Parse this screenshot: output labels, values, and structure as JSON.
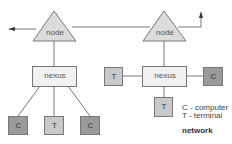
{
  "diagram": {
    "title": "network",
    "colors": {
      "line": "#777777",
      "node_fill": "#dcdcdc",
      "nexus_fill": "#f1f1f1",
      "computer_fill": "#9a9a9a",
      "terminal_fill": "#c9c9c9",
      "box_border": "#777777"
    },
    "nodes": [
      {
        "id": "node-left",
        "label": "node"
      },
      {
        "id": "node-right",
        "label": "node"
      }
    ],
    "nexuses": [
      {
        "id": "nexus-left",
        "label": "nexus"
      },
      {
        "id": "nexus-right",
        "label": "nexus"
      }
    ],
    "devices": [
      {
        "id": "device-left-1",
        "label": "C",
        "type": "computer"
      },
      {
        "id": "device-left-2",
        "label": "T",
        "type": "terminal"
      },
      {
        "id": "device-left-3",
        "label": "C",
        "type": "computer"
      },
      {
        "id": "device-right-left",
        "label": "T",
        "type": "terminal"
      },
      {
        "id": "device-right-right",
        "label": "C",
        "type": "computer"
      },
      {
        "id": "device-right-bottom",
        "label": "T",
        "type": "terminal"
      }
    ],
    "legend": [
      {
        "text": "C - computer"
      },
      {
        "text": "T - terminal"
      }
    ]
  }
}
